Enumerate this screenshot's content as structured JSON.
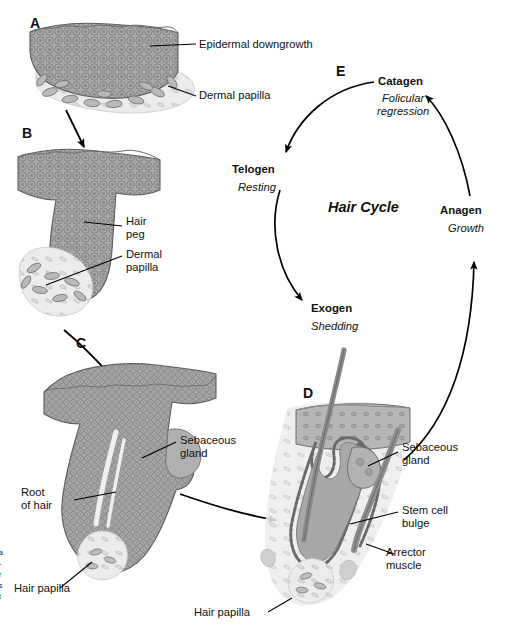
{
  "figure": {
    "panels": [
      {
        "id": "A",
        "letter": "A",
        "name": "epidermal-downgrowth-stage"
      },
      {
        "id": "B",
        "letter": "B",
        "name": "hair-peg-stage"
      },
      {
        "id": "C",
        "letter": "C",
        "name": "follicle-elongation-stage"
      },
      {
        "id": "D",
        "letter": "D",
        "name": "mature-follicle-stage"
      },
      {
        "id": "E",
        "letter": "E",
        "name": "hair-cycle-diagram"
      }
    ]
  },
  "labels": {
    "a_epidermal_downgrowth": "Epidermal downgrowth",
    "a_dermal_papilla": "Dermal papilla",
    "b_hair_peg": "Hair\npeg",
    "b_dermal_papilla": "Dermal\npapilla",
    "c_sebaceous_gland": "Sebaceous\ngland",
    "c_root_of_hair": "Root\nof hair",
    "c_hair_papilla": "Hair papilla",
    "d_sebaceous_gland": "Sebaceous\ngland",
    "d_stem_cell_bulge": "Stem cell\nbulge",
    "d_arrector_muscle": "Arrector\nmuscle",
    "d_hair_papilla": "Hair papilla"
  },
  "hair_cycle": {
    "title": "Hair Cycle",
    "stages": [
      {
        "name": "Catagen",
        "subtitle": "Folicular\nregression"
      },
      {
        "name": "Telogen",
        "subtitle": "Resting"
      },
      {
        "name": "Exogen",
        "subtitle": "Shedding"
      },
      {
        "name": "Anagen",
        "subtitle": "Growth"
      }
    ]
  },
  "edge_caption": {
    "lines": [
      "a",
      "-",
      "r",
      "s",
      "t"
    ]
  },
  "colors": {
    "tissue_fill": "#a3a3a3",
    "tissue_outline": "#5d5d5d",
    "epidermis_fill": "#b4b4b4",
    "dermis_fill": "#d8d8d8",
    "hair_shaft": "#8f8f8f",
    "line": "#000000",
    "background": "#ffffff",
    "text": "#111111"
  }
}
